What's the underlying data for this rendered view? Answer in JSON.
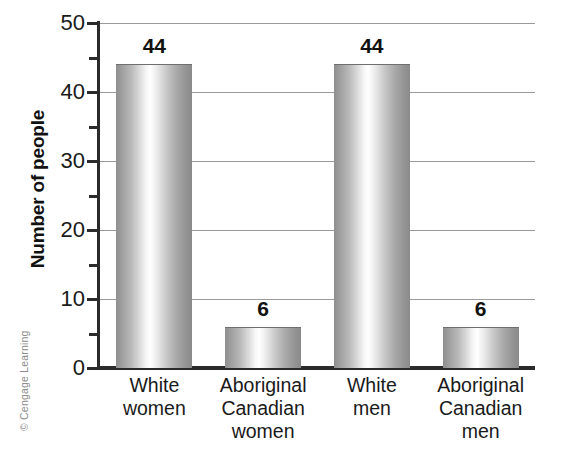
{
  "credit": {
    "text": "© Cengage Learning"
  },
  "chart_data": {
    "type": "bar",
    "title": "",
    "xlabel": "",
    "ylabel": "Number of people",
    "ylim": [
      0,
      50
    ],
    "ytick_labels": [
      "0",
      "10",
      "20",
      "30",
      "40",
      "50"
    ],
    "ytick_values": [
      0,
      10,
      20,
      30,
      40,
      50
    ],
    "yminor_values": [
      5,
      15,
      25,
      35,
      45
    ],
    "grid": "horizontal",
    "legend": "none",
    "categories": [
      "White women",
      "Aboriginal Canadian women",
      "White men",
      "Aboriginal Canadian men"
    ],
    "category_lines": [
      [
        "White",
        "women"
      ],
      [
        "Aboriginal",
        "Canadian",
        "women"
      ],
      [
        "White",
        "men"
      ],
      [
        "Aboriginal",
        "Canadian",
        "men"
      ]
    ],
    "values": [
      44,
      6,
      44,
      6
    ],
    "value_labels": [
      "44",
      "6",
      "44",
      "6"
    ],
    "bar_style": {
      "edge_color": "#8e8e8e",
      "highlight_color": "#ffffff",
      "outline_color": "#6f6f6f"
    },
    "axis_color": "#2b2b2b",
    "gridline_color": "#9a9a9a"
  }
}
